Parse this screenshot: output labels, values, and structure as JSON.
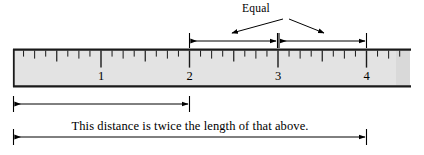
{
  "figure": {
    "type": "ruler-diagram",
    "width": 424,
    "height": 155,
    "background_color": "#ffffff",
    "line_color": "#000000"
  },
  "ruler": {
    "name": "ruler",
    "fill_color": "#e3e3e3",
    "border_color": "#000000",
    "left_px": 13,
    "right_px": 410,
    "top_px": 49,
    "bottom_px": 87,
    "unit_spacing_px": 88.5,
    "origin_px": 12.5,
    "subdivisions_per_unit": 8,
    "tick_labels": [
      "1",
      "2",
      "3",
      "4"
    ],
    "tick_values": [
      1,
      2,
      3,
      4
    ]
  },
  "annotations": {
    "equal_label": "Equal",
    "caption": "This distance is twice the length of that above.",
    "top_measure_left": {
      "name": "measure-2-to-3",
      "from_value": 2,
      "to_value": 3,
      "from_px": 189,
      "to_px": 277,
      "y_px": 41
    },
    "top_measure_right": {
      "name": "measure-3-to-4",
      "from_value": 3,
      "to_value": 4,
      "from_px": 278,
      "to_px": 366,
      "y_px": 41
    },
    "bottom_measure_short": {
      "name": "measure-0-to-2",
      "from_value": 0,
      "to_value": 2,
      "from_px": 13,
      "to_px": 189,
      "y_px": 104
    },
    "bottom_measure_long": {
      "name": "measure-0-to-4",
      "from_value": 0,
      "to_value": 4,
      "from_px": 13,
      "to_px": 366,
      "y_px": 137
    }
  },
  "chart_data": {
    "type": "diagram",
    "title": "",
    "xlabel": "",
    "ylabel": "",
    "categories": [
      "1",
      "2",
      "3",
      "4"
    ],
    "values": [
      1,
      2,
      3,
      4
    ],
    "annotations": [
      "Equal",
      "This distance is twice the length of that above."
    ]
  }
}
